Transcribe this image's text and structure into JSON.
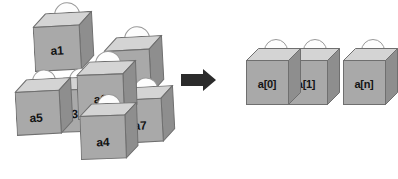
{
  "diagram": {
    "arrow": {
      "name": "transform-arrow",
      "direction": "right",
      "color": "#2b2b2b"
    },
    "ellipsis": {
      "text": "···"
    },
    "colors": {
      "box_front": "#a9a9a9",
      "box_top": "#d4d4d4",
      "box_side": "#8e8e8e",
      "box_outline": "#6f6f6f",
      "ball_fill": "#fdfdfd",
      "ball_outline": "#9a9a9a",
      "label_text": "#141414",
      "background": "#ffffff"
    },
    "cluster": {
      "name": "unordered-cluster",
      "caption": "",
      "boxes": [
        {
          "label": "a1",
          "x": 32,
          "y": 14,
          "w": 46,
          "h": 44,
          "depth": 13,
          "rot": -3,
          "ballr": 13,
          "ballx": 22,
          "bally": -10,
          "z": 5,
          "labeldx": 0,
          "labeldy": 3
        },
        {
          "label": "a2",
          "x": 103,
          "y": 38,
          "w": 45,
          "h": 44,
          "depth": 13,
          "rot": -3,
          "ballr": 13,
          "ballx": 21,
          "bally": -10,
          "z": 6,
          "labeldx": 1,
          "labeldy": 7
        },
        {
          "label": "a3",
          "x": 51,
          "y": 78,
          "w": 44,
          "h": 42,
          "depth": 12,
          "rot": -2,
          "ballr": 12,
          "ballx": 18,
          "bally": -9,
          "z": 7,
          "labeldx": -3,
          "labeldy": 4
        },
        {
          "label": "a4",
          "x": 79,
          "y": 104,
          "w": 45,
          "h": 43,
          "depth": 12,
          "rot": -2,
          "ballr": 12,
          "ballx": 18,
          "bally": -9,
          "z": 12,
          "labeldx": 0,
          "labeldy": 5
        },
        {
          "label": "a5",
          "x": 14,
          "y": 80,
          "w": 44,
          "h": 43,
          "depth": 12,
          "rot": -3,
          "ballr": 12,
          "ballx": 18,
          "bally": -9,
          "z": 8,
          "labeldx": -2,
          "labeldy": 5
        },
        {
          "label": "a6",
          "x": 76,
          "y": 62,
          "w": 46,
          "h": 44,
          "depth": 13,
          "rot": -2,
          "ballr": 13,
          "ballx": 19,
          "bally": -10,
          "z": 10,
          "labeldx": 0,
          "labeldy": 3
        },
        {
          "label": "a7",
          "x": 116,
          "y": 88,
          "w": 44,
          "h": 43,
          "depth": 12,
          "rot": -3,
          "ballr": 12,
          "ballx": 18,
          "bally": -9,
          "z": 9,
          "labeldx": 0,
          "labeldy": 5
        }
      ]
    },
    "array": {
      "name": "ordered-array",
      "caption": "",
      "boxes": [
        {
          "label": "a[0]",
          "x": 246,
          "y": 48,
          "w": 42,
          "h": 44,
          "depth": 12,
          "rot": 0,
          "ballr": 12,
          "ballx": 18,
          "bally": -9,
          "z": 3,
          "labeldx": 0,
          "labeldy": 2
        },
        {
          "label": "a[1]",
          "x": 285,
          "y": 48,
          "w": 42,
          "h": 44,
          "depth": 12,
          "rot": 0,
          "ballr": 12,
          "ballx": 18,
          "bally": -9,
          "z": 2,
          "labeldx": 0,
          "labeldy": 2
        },
        {
          "label": "a[n]",
          "x": 343,
          "y": 48,
          "w": 42,
          "h": 44,
          "depth": 12,
          "rot": 0,
          "ballr": 12,
          "ballx": 18,
          "bally": -9,
          "z": 1,
          "labeldx": 0,
          "labeldy": 2
        }
      ]
    }
  }
}
